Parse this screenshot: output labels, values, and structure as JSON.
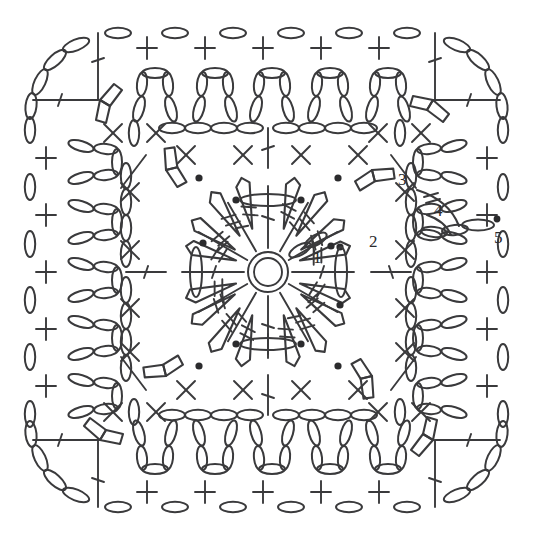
{
  "figure": {
    "kind": "crochet-diagram",
    "width": 533,
    "height": 540,
    "background_color": "#ffffff",
    "ink_color": "#3a3a3c",
    "label_color": "#2b2b2d"
  },
  "center": {
    "name": "magic-ring",
    "cx": 268,
    "cy": 272,
    "outer_r": 20,
    "inner_r": 14
  },
  "round_labels": [
    {
      "text": "1",
      "x": 313,
      "y": 263
    },
    {
      "text": "2",
      "x": 369,
      "y": 247
    },
    {
      "text": "3",
      "x": 398,
      "y": 185
    },
    {
      "text": "4",
      "x": 434,
      "y": 216
    },
    {
      "text": "5",
      "x": 494,
      "y": 243
    }
  ],
  "symbols": {
    "chain": "oval",
    "single_crochet": "cross",
    "double_crochet": "t-bar-one-slash",
    "treble_crochet": "t-bar-two-slash",
    "cluster": "fan-of-tapered-posts",
    "slip_stitch": "filled-dot",
    "picot_arch": "chain-arch"
  },
  "structure": {
    "rounds": 5,
    "symmetry": "4-fold rotational",
    "inner_square_top_y": 128,
    "inner_square_bottom_y": 415,
    "inner_chain_column_left_x": 126,
    "inner_chain_column_right_x": 411,
    "outer_border_inset": 30
  },
  "legend_note": {
    "round_1": "magic ring with radiating posts",
    "round_2": "tapered cluster fans",
    "round_3": "corner chain turns",
    "round_4": "chain arches with single crochet",
    "round_5": "outer chain edging"
  }
}
